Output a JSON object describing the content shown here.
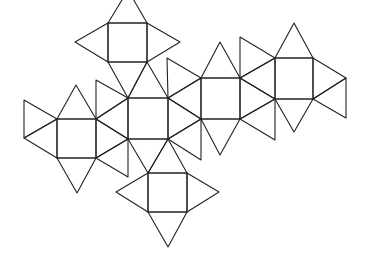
{
  "diagram": {
    "type": "polyhedron-net",
    "stroke_color": "#222222",
    "background": "#ffffff",
    "squares": [
      [
        [
          108,
          23
        ],
        [
          147,
          23
        ],
        [
          147,
          62
        ],
        [
          108,
          62
        ]
      ],
      [
        [
          128,
          98
        ],
        [
          168,
          98
        ],
        [
          168,
          139
        ],
        [
          128,
          139
        ]
      ],
      [
        [
          201,
          78
        ],
        [
          240,
          78
        ],
        [
          240,
          119
        ],
        [
          201,
          119
        ]
      ],
      [
        [
          275,
          58
        ],
        [
          313,
          58
        ],
        [
          313,
          99
        ],
        [
          275,
          99
        ]
      ],
      [
        [
          57,
          119
        ],
        [
          96,
          119
        ],
        [
          96,
          158
        ],
        [
          57,
          158
        ]
      ],
      [
        [
          148,
          173
        ],
        [
          187,
          173
        ],
        [
          187,
          212
        ],
        [
          148,
          212
        ]
      ]
    ],
    "triangles": [
      [
        [
          108,
          23
        ],
        [
          147,
          23
        ],
        [
          128,
          -10
        ]
      ],
      [
        [
          108,
          23
        ],
        [
          108,
          62
        ],
        [
          75,
          42
        ]
      ],
      [
        [
          147,
          23
        ],
        [
          147,
          62
        ],
        [
          180,
          42
        ]
      ],
      [
        [
          108,
          62
        ],
        [
          147,
          62
        ],
        [
          128,
          98
        ]
      ],
      [
        [
          147,
          62
        ],
        [
          128,
          98
        ],
        [
          168,
          98
        ]
      ],
      [
        [
          168,
          98
        ],
        [
          167,
          58
        ],
        [
          201,
          78
        ]
      ],
      [
        [
          168,
          98
        ],
        [
          201,
          78
        ],
        [
          201,
          119
        ]
      ],
      [
        [
          168,
          98
        ],
        [
          168,
          139
        ],
        [
          201,
          119
        ]
      ],
      [
        [
          168,
          139
        ],
        [
          201,
          119
        ],
        [
          201,
          160
        ]
      ],
      [
        [
          201,
          78
        ],
        [
          240,
          78
        ],
        [
          220,
          42
        ]
      ],
      [
        [
          201,
          119
        ],
        [
          240,
          119
        ],
        [
          220,
          155
        ]
      ],
      [
        [
          240,
          78
        ],
        [
          240,
          37
        ],
        [
          275,
          58
        ]
      ],
      [
        [
          240,
          78
        ],
        [
          275,
          58
        ],
        [
          275,
          99
        ]
      ],
      [
        [
          240,
          78
        ],
        [
          240,
          119
        ],
        [
          275,
          99
        ]
      ],
      [
        [
          240,
          119
        ],
        [
          275,
          99
        ],
        [
          275,
          140
        ]
      ],
      [
        [
          275,
          58
        ],
        [
          313,
          58
        ],
        [
          294,
          23
        ]
      ],
      [
        [
          275,
          99
        ],
        [
          313,
          99
        ],
        [
          294,
          132
        ]
      ],
      [
        [
          313,
          58
        ],
        [
          313,
          99
        ],
        [
          346,
          78
        ]
      ],
      [
        [
          313,
          99
        ],
        [
          346,
          78
        ],
        [
          346,
          118
        ]
      ],
      [
        [
          57,
          119
        ],
        [
          96,
          119
        ],
        [
          76,
          85
        ]
      ],
      [
        [
          57,
          119
        ],
        [
          57,
          158
        ],
        [
          24,
          138
        ]
      ],
      [
        [
          57,
          119
        ],
        [
          24,
          100
        ],
        [
          24,
          138
        ]
      ],
      [
        [
          57,
          158
        ],
        [
          96,
          158
        ],
        [
          77,
          193
        ]
      ],
      [
        [
          96,
          119
        ],
        [
          96,
          80
        ],
        [
          128,
          98
        ]
      ],
      [
        [
          96,
          119
        ],
        [
          128,
          98
        ],
        [
          128,
          139
        ]
      ],
      [
        [
          96,
          119
        ],
        [
          96,
          158
        ],
        [
          128,
          139
        ]
      ],
      [
        [
          96,
          158
        ],
        [
          128,
          139
        ],
        [
          128,
          177
        ]
      ],
      [
        [
          128,
          139
        ],
        [
          168,
          139
        ],
        [
          148,
          173
        ]
      ],
      [
        [
          168,
          139
        ],
        [
          148,
          173
        ],
        [
          187,
          173
        ]
      ],
      [
        [
          148,
          173
        ],
        [
          148,
          212
        ],
        [
          116,
          192
        ]
      ],
      [
        [
          187,
          173
        ],
        [
          187,
          212
        ],
        [
          219,
          192
        ]
      ],
      [
        [
          148,
          212
        ],
        [
          187,
          212
        ],
        [
          168,
          247
        ]
      ]
    ]
  }
}
